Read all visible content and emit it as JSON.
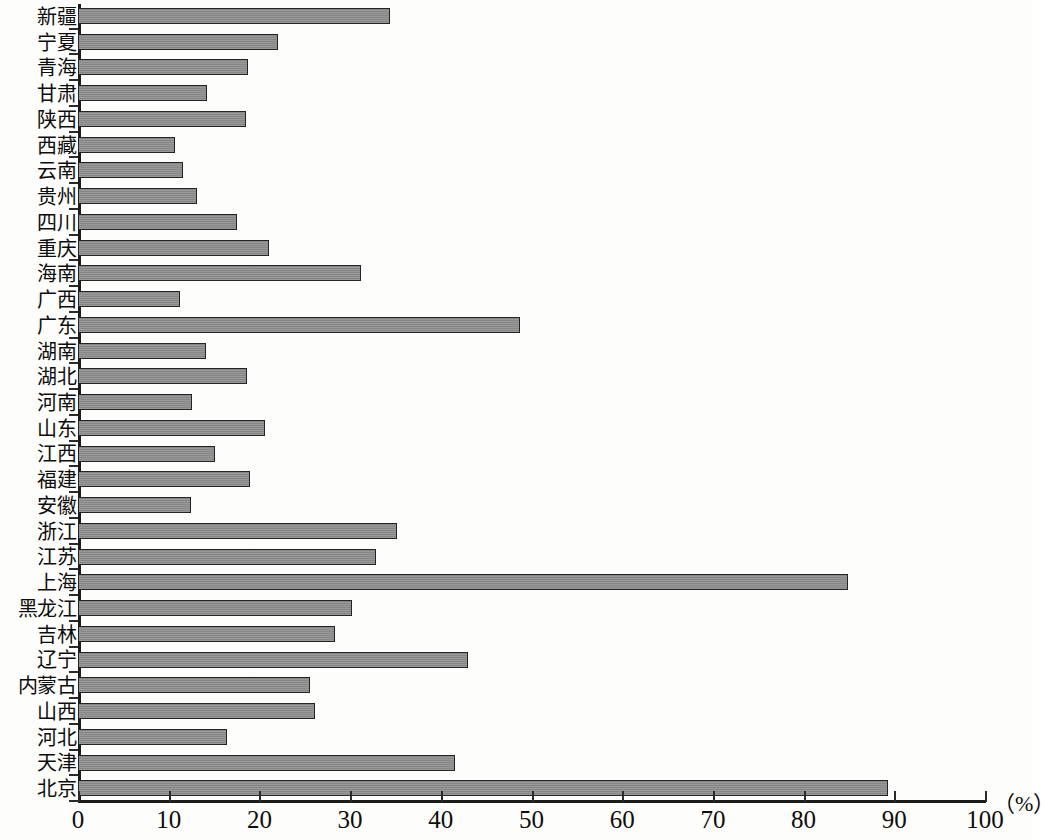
{
  "chart_data": {
    "type": "bar",
    "orientation": "horizontal",
    "title": "",
    "xlabel": "(%)",
    "ylabel": "",
    "xlim": [
      0,
      100
    ],
    "xticks": [
      0,
      10,
      20,
      30,
      40,
      50,
      60,
      70,
      80,
      90,
      100
    ],
    "grid": false,
    "legend": null,
    "bar_color": "#8d8d8d",
    "bar_border_color": "#242424",
    "axis_color": "#1c1c1c",
    "categories": [
      "新疆",
      "宁夏",
      "青海",
      "甘肃",
      "陕西",
      "西藏",
      "云南",
      "贵州",
      "四川",
      "重庆",
      "海南",
      "广西",
      "广东",
      "湖南",
      "湖北",
      "河南",
      "山东",
      "江西",
      "福建",
      "安徽",
      "浙江",
      "江苏",
      "上海",
      "黑龙江",
      "吉林",
      "辽宁",
      "内蒙古",
      "山西",
      "河北",
      "天津",
      "北京"
    ],
    "values": [
      34.4,
      22.0,
      18.7,
      14.2,
      18.5,
      10.7,
      11.6,
      13.1,
      17.5,
      21.1,
      31.2,
      11.2,
      48.7,
      14.1,
      18.6,
      12.6,
      20.6,
      15.1,
      19.0,
      12.5,
      35.2,
      32.9,
      84.9,
      30.2,
      28.3,
      43.0,
      25.6,
      26.1,
      16.4,
      41.6,
      89.3
    ]
  },
  "axis": {
    "unit": "（%）",
    "tick_labels": [
      "0",
      "10",
      "20",
      "30",
      "40",
      "50",
      "60",
      "70",
      "80",
      "90",
      "100"
    ]
  }
}
